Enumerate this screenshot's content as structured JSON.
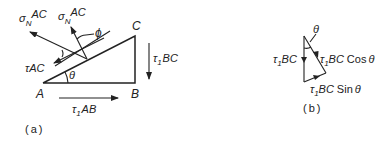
{
  "figure_a": {
    "caption": "(a)",
    "vertices": {
      "A": "A",
      "B": "B",
      "C": "C"
    },
    "angles": {
      "theta": "θ",
      "phi": "ϕ"
    },
    "forces": {
      "sigma_n_ac_1": {
        "symbol": "σ",
        "sub": "N",
        "rest": "AC"
      },
      "sigma_n_ac_2": {
        "symbol": "σ",
        "sub": "N",
        "rest": "AC"
      },
      "tau_ac": {
        "symbol": "τ",
        "rest": "AC"
      },
      "tau1_bc": {
        "symbol": "τ",
        "sub": "1",
        "rest": "BC"
      },
      "tau1_ab": {
        "symbol": "τ",
        "sub": "1",
        "rest": "AB"
      }
    }
  },
  "figure_b": {
    "caption": "(b)",
    "angle": "θ",
    "forces": {
      "tau1_bc": {
        "symbol": "τ",
        "sub": "1",
        "rest": "BC"
      },
      "tau1_bc_cos": {
        "symbol": "τ",
        "sub": "1",
        "rest": "BC",
        "func": "Cos",
        "arg": "θ"
      },
      "tau1_bc_sin": {
        "symbol": "τ",
        "sub": "1",
        "rest": "BC",
        "func": "Sin",
        "arg": "θ"
      }
    }
  }
}
